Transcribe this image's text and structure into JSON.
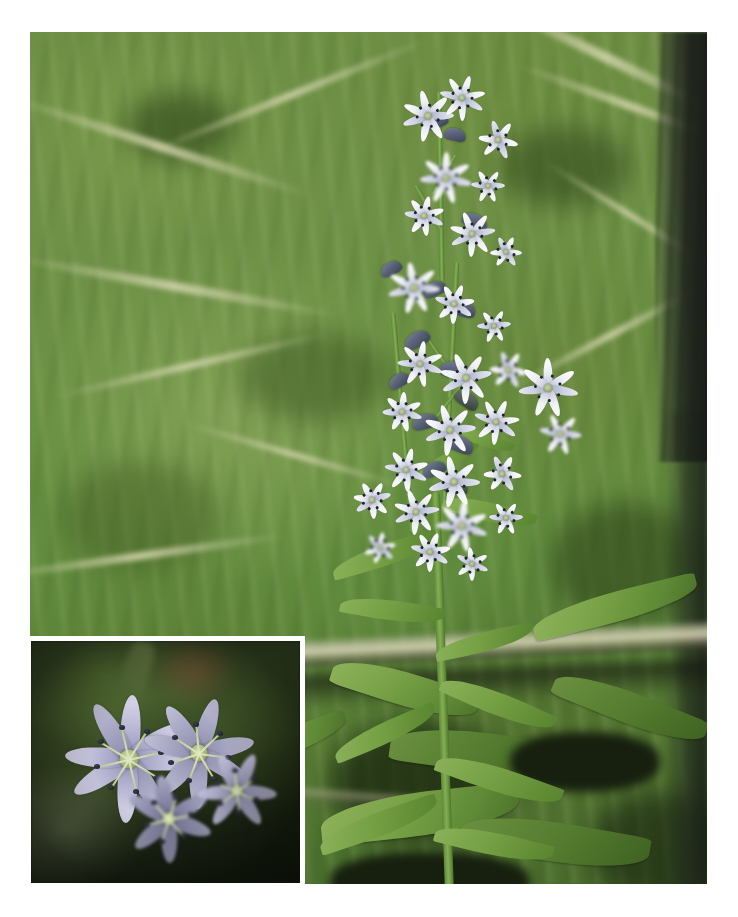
{
  "page": {
    "background_color": "#ffffff",
    "width": 738,
    "height": 917
  },
  "main_photo": {
    "name": "main-photograph",
    "alt": "Tall slender wildflower spike with pale blue-white star-shaped flowers growing among blurred green grass, a dark tree trunk at the right edge and a fallen pale branch crossing the lower field",
    "subject": "flowering plant stem with terminal raceme of star-shaped flowers",
    "frame": {
      "left": 30,
      "top": 32,
      "width": 677,
      "height": 852
    },
    "colors": {
      "background_green_light": "#6f9147",
      "background_green_mid": "#5f8a3c",
      "background_green_dark": "#44682a",
      "straw_blade": "#ced0a8",
      "trunk_dark": "#1a1e18",
      "stem_green": "#6e9a42",
      "leaf_green": "#75a044",
      "petal_white": "#fdfdfb",
      "petal_shadow_blue": "#b7bbcd",
      "anther_dark": "#1d2230",
      "flower_core_green": "#a6b77e"
    },
    "elements": {
      "stem_label": "main stem",
      "leaf_label": "lance-shaped leaf",
      "flower_label": "star-shaped flower",
      "bud_label": "flower bud",
      "branch_label": "fallen branch",
      "trunk_label": "tree trunk"
    }
  },
  "inset_photo": {
    "name": "closeup-inset-photograph",
    "alt": "Macro close-up of pale lavender star-shaped flowers with narrow pointed petals, dark anthers on pale filaments and a green central disc, against a dark blurred background",
    "frame": {
      "left": 27,
      "top": 637,
      "width": 277,
      "height": 250
    },
    "border_color": "#ffffff",
    "border_width": 4,
    "colors": {
      "petal_lavender_light": "#d7d6e8",
      "petal_lavender_mid": "#a9a8c9",
      "petal_lavender_dark": "#6e6d8c",
      "core_green": "#aebb80",
      "filament": "#cdd79a",
      "anther": "#14171f",
      "background_dark": "#1b2416",
      "background_green": "#3d4f28",
      "background_brown": "#785c38"
    },
    "elements": {
      "petal_label": "flower petal",
      "core_label": "flower center",
      "anther_label": "anther",
      "filament_label": "filament"
    }
  }
}
